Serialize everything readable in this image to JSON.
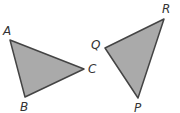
{
  "triangles": [
    {
      "name": "ABC",
      "vertices": [
        {
          "label": "A",
          "x": 10,
          "y": 40,
          "lx": 3,
          "ly": 35
        },
        {
          "label": "B",
          "x": 25,
          "y": 97,
          "lx": 20,
          "ly": 111
        },
        {
          "label": "C",
          "x": 84,
          "y": 69,
          "lx": 88,
          "ly": 73
        }
      ]
    },
    {
      "name": "PQR",
      "vertices": [
        {
          "label": "Q",
          "x": 105,
          "y": 48,
          "lx": 91,
          "ly": 49
        },
        {
          "label": "R",
          "x": 164,
          "y": 19,
          "lx": 162,
          "ly": 13
        },
        {
          "label": "P",
          "x": 138,
          "y": 98,
          "lx": 134,
          "ly": 112
        }
      ]
    }
  ],
  "colors": {
    "fill": "#aaaaaa",
    "stroke": "#444444"
  }
}
